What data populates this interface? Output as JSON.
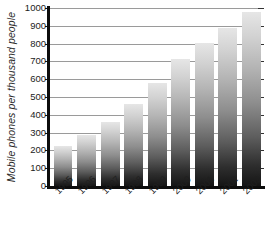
{
  "chart_data": {
    "type": "bar",
    "title": "",
    "subtitle": "",
    "xlabel": "",
    "ylabel": "Mobile phones per thousand people",
    "categories": [
      "1995",
      "1996",
      "1997",
      "1998",
      "1999",
      "2000",
      "2001",
      "2002",
      "2003"
    ],
    "values": [
      225,
      285,
      358,
      462,
      580,
      715,
      805,
      890,
      980
    ],
    "series": [
      {
        "name": "Mobile phones per thousand people",
        "values": [
          225,
          285,
          358,
          462,
          580,
          715,
          805,
          890,
          980
        ]
      }
    ],
    "ylim": [
      0,
      1000
    ],
    "ytick_labels": [
      "0",
      "100",
      "200",
      "300",
      "400",
      "500",
      "600",
      "700",
      "800",
      "900",
      "1000"
    ],
    "ytick_values": [
      0,
      100,
      200,
      300,
      400,
      500,
      600,
      700,
      800,
      900,
      1000
    ],
    "ytick_step": 100,
    "grid": true,
    "grid_axis": "y",
    "legend": false,
    "legend_position": "none",
    "bar_orientation": "vertical",
    "bar_fill": "vertical-gradient-light-to-dark",
    "colors": {
      "bar_top": "#e6e6e6",
      "bar_bottom": "#151515",
      "gridline": "#9a9a9a",
      "axis": "#0d0d0d",
      "text": "#1f1f1f",
      "background": "#ffffff"
    },
    "xtick_label_rotation": -45
  }
}
